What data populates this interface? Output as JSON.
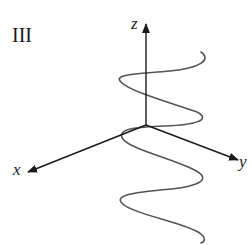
{
  "figure": {
    "panel_label": "III",
    "axes": {
      "x": {
        "label": "x"
      },
      "y": {
        "label": "y"
      },
      "z": {
        "label": "z"
      }
    },
    "curve": {
      "description": "sinusoidal wave oscillating in the x-y plane while advancing along the z axis",
      "color": "#555555"
    },
    "axis_color": "#1a1a1a"
  }
}
